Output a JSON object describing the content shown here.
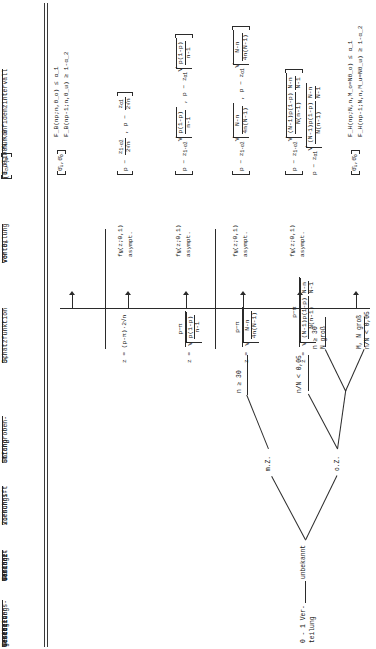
{
  "document": {
    "kind": "statistics-reference-table",
    "language": "de",
    "orientation": "rotated-90"
  },
  "columns": [
    {
      "id": "verteilungsgesetz",
      "lines": [
        "Verteilungs-",
        "gesetz der",
        "Grundge-",
        "samtheit"
      ]
    },
    {
      "id": "varianz",
      "lines": [
        "Varianz",
        "der",
        "Grundge-",
        "samtheit"
      ]
    },
    {
      "id": "ziehungsvorschrift",
      "lines": [
        "Ziehungs-",
        "vorschrift"
      ]
    },
    {
      "id": "stichprobenumfang",
      "lines": [
        "Stichproben-",
        "umfang"
      ]
    },
    {
      "id": "schaetzfunktion",
      "lines": [
        "Schätzfunktion",
        "D_t"
      ]
    },
    {
      "id": "verteilung_dt",
      "lines": [
        "Verteilung",
        "von D_t"
      ]
    },
    {
      "id": "konfidenzintervall",
      "lines": [
        "(1-α)100% Konfidenzintervall",
        "[θ_u , θ_o]  für θ"
      ]
    }
  ],
  "tree": {
    "root": {
      "label_lines": [
        "0 - 1 Ver-",
        "teilung"
      ]
    },
    "variance": {
      "label": "unbekannt"
    },
    "draw_methods": [
      {
        "id": "mz",
        "label": "m.Z."
      },
      {
        "id": "oz",
        "label": "o.Z."
      }
    ],
    "sample_conditions": [
      {
        "id": "c1",
        "parent": "mz",
        "lines": [
          "n ≥ 30"
        ]
      },
      {
        "id": "c2",
        "parent": "oz",
        "lines": [
          "n",
          "—",
          "N",
          "< 0,05"
        ],
        "text": "n/N < 0,05"
      },
      {
        "id": "c3",
        "parent": "oz",
        "lines": [
          "n ≥ 30",
          "N groß"
        ],
        "text": "n ≥ 30 ; N groß"
      },
      {
        "id": "c4",
        "parent": "oz",
        "lines": [
          "M, N groß",
          "n/N < 0,05"
        ],
        "text": "M, N groß ; n/N < 0,05"
      }
    ]
  },
  "rows": [
    {
      "id": "row1",
      "note": "exakte Binomial-Grenzen",
      "estimator": "",
      "distribution": "",
      "ci_bracket": "[θ_u , θ_o]",
      "ci_lines": [
        "F_B(np;n,θ_o) ≤ α_1",
        "F_B(np-1;n,θ_u) ≥ 1-α_2"
      ]
    },
    {
      "id": "row2",
      "estimator_num": "p - π",
      "estimator_den": "",
      "estimator_tex": "z = (p-π)·2·√n",
      "distribution": {
        "fn": "f_N(z;0,1)",
        "note": "asympt."
      },
      "ci_left": "p - z_{1-α_2} / (2√n)",
      "ci_right": "p - z_{α_1} / (2√n)"
    },
    {
      "id": "row3",
      "estimator_tex": "z = (p-π) / √( p(1-p)/(n-1) )",
      "distribution": {
        "fn": "f_N(z;0,1)",
        "note": "asympt."
      },
      "ci_left": "p - z_{1-α_2} √( p(1-p)/(n-1) )",
      "ci_right": "p - z_{α_1} √( p(1-p)/(n-1) )"
    },
    {
      "id": "row4",
      "estimator_tex": "z = (p-π) / √( (N-n)/(4n(N-1)) )",
      "distribution": {
        "fn": "f_N(z;0,1)",
        "note": "asympt."
      },
      "ci_left": "p - z_{1-α_2} √( (N-n)/(4n(N-1)) )",
      "ci_right": "p - z_{α_1} √( (N-n)/(4n(N-1)) )"
    },
    {
      "id": "row5",
      "estimator_tex": "z = (p-π) / √( (N-1)p(1-p)/(N(n-1)) · (N-n)/(N-1) )",
      "distribution": {
        "fn": "f_N(z;0,1)",
        "note": "asympt."
      },
      "ci_left": "p - z_{1-α_2} √( (N-1)p(1-p)/(N(n-1)) · (N-n)/(N-1) )",
      "ci_right": "p - z_{α_1} √( (N-1)p(1-p)/(N(n-1)) · (N-n)/(N-1) )"
    },
    {
      "id": "row6",
      "note": "exakte hypergeometrische Grenzen",
      "ci_bracket": "[θ_u , θ_o]",
      "ci_lines": [
        "F_H(np;N,n,M_o=Nθ_o) ≤ α_1",
        "F_H(np-1;N,n,M_u=Nθ_u) ≥ 1-α_2"
      ]
    }
  ],
  "symbols": {
    "alpha": "α",
    "theta": "θ",
    "pi": "π",
    "sqrt": "√",
    "ge": "≥",
    "le": "≤",
    "sub_u": "u",
    "sub_o": "o"
  },
  "colors": {
    "ink": "#1a1a1a",
    "rule": "#3a3a3a",
    "paper": "#ffffff"
  }
}
